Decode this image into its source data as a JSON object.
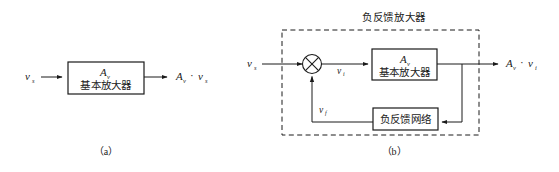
{
  "figure": {
    "background_color": "#ffffff",
    "line_color": "#1a1a1a",
    "width": 559,
    "height": 172
  },
  "panel_a": {
    "caption": "（a）",
    "input_label": {
      "symbol": "v",
      "subscript": "s"
    },
    "amplifier_box": {
      "gain_symbol": "A",
      "gain_subscript": "v",
      "name": "基本放大器"
    },
    "output_label": {
      "gain_symbol": "A",
      "gain_subscript": "v",
      "operator": "·",
      "signal_symbol": "v",
      "signal_subscript": "s"
    }
  },
  "panel_b": {
    "caption": "（b）",
    "title": "负反馈放大器",
    "input_label": {
      "symbol": "v",
      "subscript": "s"
    },
    "summing_junction": {
      "glyph": "cross-circle"
    },
    "error_label": {
      "symbol": "v",
      "subscript": "i"
    },
    "feedback_label": {
      "symbol": "v",
      "subscript": "f"
    },
    "amplifier_box": {
      "gain_symbol": "A",
      "gain_subscript": "v",
      "name": "基本放大器"
    },
    "feedback_box": {
      "name": "负反馈网络"
    },
    "output_label": {
      "gain_symbol": "A",
      "gain_subscript": "v",
      "operator": "·",
      "signal_symbol": "v",
      "signal_subscript": "i"
    }
  }
}
